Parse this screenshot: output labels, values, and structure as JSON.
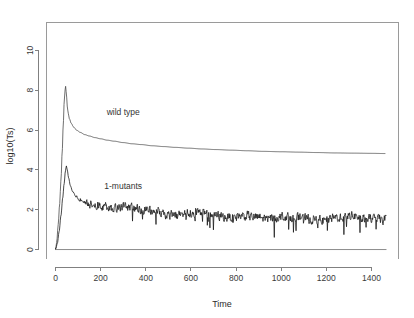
{
  "chart_data": {
    "type": "line",
    "title": "",
    "subtitle": "",
    "xlabel": "Time",
    "ylabel": "log10(Ts)",
    "xlim": [
      -40,
      1520
    ],
    "ylim": [
      -0.45,
      11.4
    ],
    "xticks": [
      0,
      200,
      400,
      600,
      800,
      1000,
      1200,
      1400
    ],
    "xticklabels": [
      "0",
      "200",
      "400",
      "600",
      "800",
      "1000",
      "1200",
      "1400"
    ],
    "yticks": [
      0,
      2,
      4,
      6,
      8,
      10
    ],
    "yticklabels": [
      "0",
      "2",
      "4",
      "6",
      "8",
      "10"
    ],
    "grid": false,
    "legend": "inline-annotations",
    "background": "#ffffff",
    "box": true,
    "annotations": [
      {
        "text": "wild type",
        "x": 300,
        "y": 6.75,
        "series": "wild type"
      },
      {
        "text": "1-mutants",
        "x": 300,
        "y": 3.05,
        "series": "1-mutants"
      }
    ],
    "series": [
      {
        "name": "wild type",
        "color": "#4a4a4a",
        "linewidth": 0.8,
        "noise": 0.0,
        "description": "Sharp rise from 0 to peak 8.2 near t=45, then smooth monotonic decay toward asymptote 4.8",
        "x": [
          0,
          5,
          12,
          18,
          24,
          30,
          34,
          38,
          42,
          45,
          48,
          52,
          56,
          62,
          70,
          80,
          95,
          110,
          130,
          150,
          175,
          200,
          230,
          260,
          300,
          340,
          380,
          430,
          480,
          530,
          590,
          650,
          710,
          780,
          850,
          920,
          1000,
          1080,
          1160,
          1240,
          1320,
          1400,
          1460
        ],
        "y": [
          0.0,
          0.35,
          1.25,
          2.25,
          3.45,
          5.0,
          6.2,
          7.3,
          8.0,
          8.2,
          7.85,
          7.2,
          6.85,
          6.55,
          6.33,
          6.15,
          5.98,
          5.88,
          5.77,
          5.7,
          5.62,
          5.56,
          5.49,
          5.44,
          5.37,
          5.31,
          5.27,
          5.21,
          5.17,
          5.13,
          5.09,
          5.05,
          5.02,
          4.99,
          4.96,
          4.93,
          4.91,
          4.89,
          4.87,
          4.85,
          4.84,
          4.83,
          4.82
        ]
      },
      {
        "name": "1-mutants",
        "color": "#1a1a1a",
        "linewidth": 0.8,
        "noise": 0.33,
        "description": "Sharp rise from 0 to peak 4.2 near t=48, decay to a noisy plateau fluctuating about 1.6-2.2 with high-frequency jitter",
        "x": [
          0,
          8,
          16,
          24,
          32,
          38,
          44,
          48,
          52,
          58,
          66,
          76,
          90,
          110,
          135,
          160,
          190,
          220,
          260,
          300,
          345,
          390,
          440,
          490,
          545,
          600,
          655,
          710,
          770,
          830,
          890,
          950,
          1010,
          1070,
          1130,
          1190,
          1250,
          1310,
          1370,
          1430,
          1465
        ],
        "y": [
          0.0,
          0.3,
          0.9,
          1.7,
          2.6,
          3.3,
          3.95,
          4.2,
          4.0,
          3.6,
          3.2,
          2.9,
          2.66,
          2.5,
          2.38,
          2.3,
          2.25,
          2.2,
          2.12,
          2.16,
          2.05,
          2.0,
          1.95,
          1.78,
          1.72,
          1.85,
          1.8,
          1.7,
          1.62,
          1.7,
          1.62,
          1.55,
          1.68,
          1.6,
          1.52,
          1.45,
          1.62,
          1.7,
          1.58,
          1.52,
          1.5
        ]
      },
      {
        "name": "baseline",
        "color": "#6e6e6e",
        "linewidth": 0.8,
        "noise": 0.0,
        "description": "Flat reference line at y = 0 spanning the full time range",
        "x": [
          0,
          1465
        ],
        "y": [
          0.0,
          0.0
        ]
      }
    ]
  },
  "axes": {
    "x_title": "Time",
    "y_title": "log10(Ts)"
  }
}
